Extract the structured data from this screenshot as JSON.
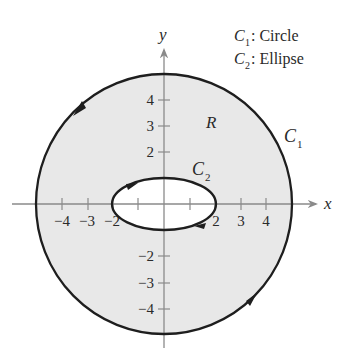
{
  "diagram": {
    "type": "region-between-curves",
    "colors": {
      "region_fill": "#e8e8e8",
      "curve_stroke": "#1e1e1e",
      "axis_stroke": "#8a8a8a",
      "hole_fill": "#ffffff",
      "text": "#2a2a2a"
    },
    "axes": {
      "x_label": "x",
      "y_label": "y",
      "x_ticks": [
        -4,
        -3,
        -2,
        -1,
        1,
        2,
        3,
        4
      ],
      "x_tick_labels": [
        "−4",
        "−3",
        "−2",
        "2",
        "3",
        "4"
      ],
      "y_ticks": [
        -4,
        -3,
        -2,
        -1,
        1,
        2,
        3,
        4
      ],
      "y_tick_labels": [
        "4",
        "3",
        "2",
        "−2",
        "−3",
        "−4"
      ],
      "range": [
        -5,
        5
      ]
    },
    "region_label": "R",
    "curves": [
      {
        "name": "C1",
        "label_main": "C",
        "label_sub": "1",
        "shape": "Circle",
        "radius": 5,
        "orientation": "counterclockwise"
      },
      {
        "name": "C2",
        "label_main": "C",
        "label_sub": "2",
        "shape": "Ellipse",
        "semi_axes": [
          2,
          1
        ],
        "orientation": "clockwise"
      }
    ],
    "legend": [
      {
        "main": "C",
        "sub": "1",
        "text": ": Circle"
      },
      {
        "main": "C",
        "sub": "2",
        "text": ": Ellipse"
      }
    ]
  }
}
